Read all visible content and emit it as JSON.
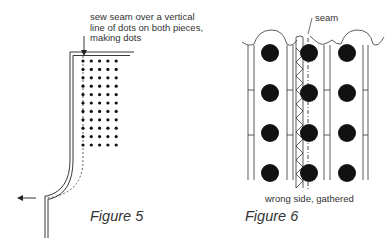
{
  "figure5": {
    "caption": "Figure 5",
    "annotation": {
      "line1": "sew seam over a vertical",
      "line2": "line of dots on both pieces,",
      "line3": "making dots"
    },
    "dot_grid": {
      "columns": 5,
      "rows": 11
    }
  },
  "figure6": {
    "caption": "Figure 6",
    "seam_label": "seam",
    "bottom_label": "wrong side, gathered",
    "dot_grid": {
      "columns": 3,
      "rows": 4
    }
  },
  "colors": {
    "ink": "#1a1a1a",
    "background": "#ffffff"
  }
}
